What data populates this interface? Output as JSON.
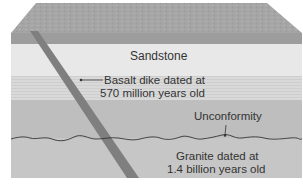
{
  "diagram": {
    "type": "geologic cross-section block",
    "layers": [
      {
        "id": "top-surface",
        "label": "",
        "color": "#9a9a9a"
      },
      {
        "id": "sandstone",
        "label": "Sandstone",
        "color": "#e6e6e6"
      },
      {
        "id": "striped-band",
        "label": "",
        "color": "#d8d8d8"
      },
      {
        "id": "lower-sediment",
        "label": "",
        "color": "#bdbdbd"
      },
      {
        "id": "granite",
        "label": "Granite dated at 1.4 billion years old",
        "color": "#c4c4c4"
      }
    ],
    "dike_color": "#7e7e7e",
    "line_color": "#333333"
  },
  "labels": {
    "sandstone": "Sandstone",
    "basalt_line1": "Basalt dike dated at",
    "basalt_line2": "570 million years old",
    "unconformity": "Unconformity",
    "granite_line1": "Granite dated at",
    "granite_line2": "1.4 billion years old"
  }
}
